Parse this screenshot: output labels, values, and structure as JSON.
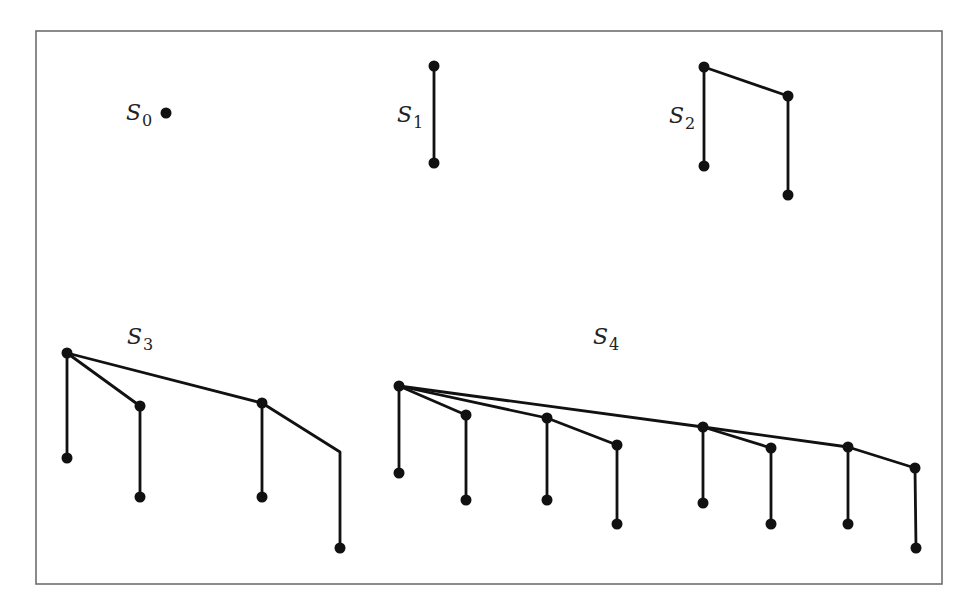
{
  "figure": {
    "type": "binomial-trees",
    "frame": {
      "x1": 36,
      "y1": 31,
      "x2": 942,
      "y2": 584
    },
    "node_radius": 5.5
  },
  "trees": [
    {
      "id": "S0",
      "label": {
        "base": "S",
        "sub": "0",
        "x": 126,
        "y": 102
      },
      "nodes": [
        [
          166,
          113
        ]
      ],
      "edges": []
    },
    {
      "id": "S1",
      "label": {
        "base": "S",
        "sub": "1",
        "x": 397,
        "y": 104
      },
      "nodes": [
        [
          434,
          66
        ],
        [
          434,
          163
        ]
      ],
      "edges": [
        [
          [
            434,
            66
          ],
          [
            434,
            163
          ]
        ]
      ]
    },
    {
      "id": "S2",
      "label": {
        "base": "S",
        "sub": "2",
        "x": 669,
        "y": 105
      },
      "nodes": [
        [
          704,
          67
        ],
        [
          788,
          96
        ],
        [
          704,
          166
        ],
        [
          788,
          195
        ]
      ],
      "edges": [
        [
          [
            704,
            67
          ],
          [
            788,
            96
          ]
        ],
        [
          [
            704,
            67
          ],
          [
            704,
            166
          ]
        ],
        [
          [
            788,
            96
          ],
          [
            788,
            195
          ]
        ]
      ]
    },
    {
      "id": "S3",
      "label": {
        "base": "S",
        "sub": "3",
        "x": 127,
        "y": 326
      },
      "nodes": [
        [
          67,
          353
        ],
        [
          140,
          406
        ],
        [
          262,
          403
        ],
        [
          67,
          458
        ],
        [
          140,
          497
        ],
        [
          262,
          497
        ],
        [
          340,
          548
        ]
      ],
      "edges": [
        [
          [
            67,
            353
          ],
          [
            67,
            458
          ]
        ],
        [
          [
            67,
            353
          ],
          [
            140,
            406
          ]
        ],
        [
          [
            140,
            406
          ],
          [
            140,
            497
          ]
        ],
        [
          [
            67,
            353
          ],
          [
            262,
            403
          ]
        ],
        [
          [
            262,
            403
          ],
          [
            262,
            497
          ]
        ],
        [
          [
            262,
            403
          ],
          [
            340,
            452
          ],
          [
            340,
            548
          ]
        ]
      ]
    },
    {
      "id": "S4",
      "label": {
        "base": "S",
        "sub": "4",
        "x": 593,
        "y": 326
      },
      "nodes": [
        [
          399,
          386
        ],
        [
          466,
          415
        ],
        [
          547,
          418
        ],
        [
          617,
          445
        ],
        [
          703,
          427
        ],
        [
          771,
          448
        ],
        [
          848,
          447
        ],
        [
          915,
          468
        ],
        [
          399,
          473
        ],
        [
          466,
          500
        ],
        [
          547,
          500
        ],
        [
          617,
          524
        ],
        [
          703,
          503
        ],
        [
          771,
          524
        ],
        [
          848,
          524
        ],
        [
          916,
          548
        ]
      ],
      "edges": [
        [
          [
            399,
            386
          ],
          [
            399,
            473
          ]
        ],
        [
          [
            399,
            386
          ],
          [
            466,
            415
          ]
        ],
        [
          [
            466,
            415
          ],
          [
            466,
            500
          ]
        ],
        [
          [
            399,
            386
          ],
          [
            547,
            418
          ]
        ],
        [
          [
            547,
            418
          ],
          [
            547,
            500
          ]
        ],
        [
          [
            547,
            418
          ],
          [
            617,
            445
          ]
        ],
        [
          [
            617,
            445
          ],
          [
            617,
            524
          ]
        ],
        [
          [
            399,
            386
          ],
          [
            703,
            427
          ]
        ],
        [
          [
            703,
            427
          ],
          [
            703,
            503
          ]
        ],
        [
          [
            703,
            427
          ],
          [
            771,
            448
          ]
        ],
        [
          [
            771,
            448
          ],
          [
            771,
            524
          ]
        ],
        [
          [
            703,
            427
          ],
          [
            848,
            447
          ]
        ],
        [
          [
            848,
            447
          ],
          [
            848,
            524
          ]
        ],
        [
          [
            848,
            447
          ],
          [
            915,
            468
          ]
        ],
        [
          [
            915,
            468
          ],
          [
            916,
            548
          ]
        ]
      ]
    }
  ],
  "labels": {
    "s0": {
      "base": "S",
      "sub": "0"
    },
    "s1": {
      "base": "S",
      "sub": "1"
    },
    "s2": {
      "base": "S",
      "sub": "2"
    },
    "s3": {
      "base": "S",
      "sub": "3"
    },
    "s4": {
      "base": "S",
      "sub": "4"
    }
  }
}
